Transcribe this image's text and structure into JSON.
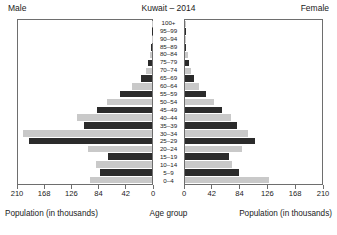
{
  "header": {
    "male_label": "Male",
    "title": "Kuwait – 2014",
    "female_label": "Female"
  },
  "footer": {
    "left_caption": "Population (in thousands)",
    "center_caption": "Age group",
    "right_caption": "Population (in thousands)"
  },
  "colors": {
    "male_bar_dark": "#2b2b2b",
    "male_bar_light": "#c9c9c9",
    "female_bar_dark": "#2b2b2b",
    "female_bar_light": "#c9c9c9",
    "frame": "#6e6e6e",
    "background": "#ffffff"
  },
  "chart_data": {
    "type": "bar",
    "subtype": "population-pyramid",
    "title": "Kuwait – 2014",
    "xlabel": "Population (in thousands)",
    "ylabel": "Age group",
    "grid": false,
    "legend": [
      "Male",
      "Female"
    ],
    "legend_position": "top-left-and-top-right",
    "axis_left_ticks": [
      210,
      168,
      126,
      84,
      42,
      0
    ],
    "axis_right_ticks": [
      0,
      42,
      84,
      126,
      168,
      210
    ],
    "xlim": [
      0,
      210
    ],
    "units": "thousands",
    "categories": [
      "100+",
      "95–99",
      "90–94",
      "85–89",
      "80–84",
      "75–79",
      "70–74",
      "65–69",
      "60–64",
      "55–59",
      "50–54",
      "45–49",
      "40–44",
      "35–39",
      "30–34",
      "25–29",
      "20–24",
      "15–19",
      "10–14",
      "5–9",
      "0–4"
    ],
    "series": [
      {
        "name": "Male",
        "side": "left",
        "values": [
          0.2,
          0.4,
          0.8,
          1.6,
          3.5,
          6.5,
          10.0,
          17.0,
          31.0,
          50.0,
          70.0,
          86.0,
          118.0,
          106.0,
          202.0,
          193.0,
          100.0,
          69.0,
          88.0,
          82.0,
          97.0
        ]
      },
      {
        "name": "Female",
        "side": "right",
        "values": [
          0.3,
          0.6,
          1.2,
          2.2,
          4.0,
          6.5,
          9.0,
          14.0,
          22.0,
          32.0,
          45.0,
          57.0,
          70.0,
          80.0,
          97.0,
          108.0,
          88.0,
          67.0,
          72.0,
          83.0,
          129.0
        ]
      }
    ]
  }
}
